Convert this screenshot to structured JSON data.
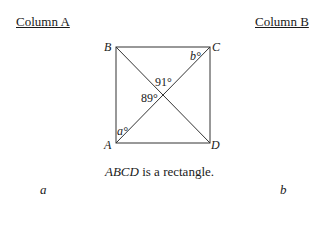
{
  "header": {
    "column_a": "Column A",
    "column_b": "Column B"
  },
  "figure": {
    "vertices": {
      "A": {
        "label": "A",
        "x": 116,
        "y": 143
      },
      "B": {
        "label": "B",
        "x": 116,
        "y": 47
      },
      "C": {
        "label": "C",
        "x": 210,
        "y": 47
      },
      "D": {
        "label": "D",
        "x": 210,
        "y": 143
      }
    },
    "angles": {
      "top": "91°",
      "left": "89°",
      "a": "a°",
      "b": "b°"
    }
  },
  "caption": {
    "italic": "ABCD",
    "rest": " is a rectangle."
  },
  "quantities": {
    "column_a": "a",
    "column_b": "b"
  }
}
